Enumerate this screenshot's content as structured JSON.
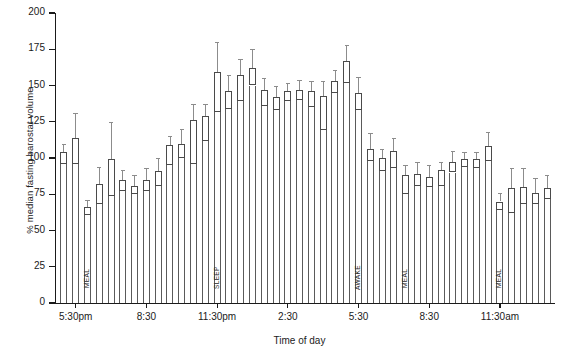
{
  "chart_data": {
    "type": "bar",
    "title": "",
    "xlabel": "Time of day",
    "ylabel": "% median fasting barostat volume",
    "ylim": [
      0,
      200
    ],
    "yticks": [
      0,
      25,
      50,
      75,
      100,
      125,
      150,
      175,
      200
    ],
    "xtick_labels": [
      "5:30pm",
      "8:30",
      "11:30pm",
      "2:30",
      "5:30",
      "8:30",
      "11:30am"
    ],
    "xtick_indices": [
      1,
      7,
      13,
      19,
      25,
      31,
      37
    ],
    "grid": false,
    "legend": null,
    "series_note": "Each bar is a box (interquartile range) drawn on a tall column from zero, with an upper whisker cap.",
    "bars": [
      {
        "i": 0,
        "box_low": 96,
        "box_high": 104,
        "whisker_high": 110,
        "annotation": ""
      },
      {
        "i": 1,
        "box_low": 96,
        "box_high": 114,
        "whisker_high": 131,
        "annotation": ""
      },
      {
        "i": 2,
        "box_low": 61,
        "box_high": 66,
        "whisker_high": 71,
        "annotation": "MEAL"
      },
      {
        "i": 3,
        "box_low": 68,
        "box_high": 82,
        "whisker_high": 94,
        "annotation": ""
      },
      {
        "i": 4,
        "box_low": 74,
        "box_high": 99,
        "whisker_high": 125,
        "annotation": ""
      },
      {
        "i": 5,
        "box_low": 77,
        "box_high": 85,
        "whisker_high": 92,
        "annotation": ""
      },
      {
        "i": 6,
        "box_low": 75,
        "box_high": 81,
        "whisker_high": 88,
        "annotation": ""
      },
      {
        "i": 7,
        "box_low": 77,
        "box_high": 85,
        "whisker_high": 93,
        "annotation": ""
      },
      {
        "i": 8,
        "box_low": 81,
        "box_high": 91,
        "whisker_high": 100,
        "annotation": ""
      },
      {
        "i": 9,
        "box_low": 95,
        "box_high": 109,
        "whisker_high": 115,
        "annotation": ""
      },
      {
        "i": 10,
        "box_low": 100,
        "box_high": 110,
        "whisker_high": 120,
        "annotation": ""
      },
      {
        "i": 11,
        "box_low": 96,
        "box_high": 126,
        "whisker_high": 137,
        "annotation": ""
      },
      {
        "i": 12,
        "box_low": 112,
        "box_high": 129,
        "whisker_high": 137,
        "annotation": ""
      },
      {
        "i": 13,
        "box_low": 132,
        "box_high": 159,
        "whisker_high": 180,
        "annotation": "SLEEP"
      },
      {
        "i": 14,
        "box_low": 134,
        "box_high": 146,
        "whisker_high": 157,
        "annotation": ""
      },
      {
        "i": 15,
        "box_low": 139,
        "box_high": 157,
        "whisker_high": 168,
        "annotation": ""
      },
      {
        "i": 16,
        "box_low": 150,
        "box_high": 162,
        "whisker_high": 175,
        "annotation": ""
      },
      {
        "i": 17,
        "box_low": 136,
        "box_high": 147,
        "whisker_high": 155,
        "annotation": ""
      },
      {
        "i": 18,
        "box_low": 133,
        "box_high": 142,
        "whisker_high": 150,
        "annotation": ""
      },
      {
        "i": 19,
        "box_low": 139,
        "box_high": 146,
        "whisker_high": 152,
        "annotation": ""
      },
      {
        "i": 20,
        "box_low": 140,
        "box_high": 147,
        "whisker_high": 154,
        "annotation": ""
      },
      {
        "i": 21,
        "box_low": 135,
        "box_high": 146,
        "whisker_high": 153,
        "annotation": ""
      },
      {
        "i": 22,
        "box_low": 119,
        "box_high": 143,
        "whisker_high": 153,
        "annotation": ""
      },
      {
        "i": 23,
        "box_low": 145,
        "box_high": 153,
        "whisker_high": 161,
        "annotation": ""
      },
      {
        "i": 24,
        "box_low": 152,
        "box_high": 167,
        "whisker_high": 178,
        "annotation": ""
      },
      {
        "i": 25,
        "box_low": 133,
        "box_high": 145,
        "whisker_high": 156,
        "annotation": "AWAKE"
      },
      {
        "i": 26,
        "box_low": 98,
        "box_high": 106,
        "whisker_high": 117,
        "annotation": ""
      },
      {
        "i": 27,
        "box_low": 91,
        "box_high": 100,
        "whisker_high": 106,
        "annotation": ""
      },
      {
        "i": 28,
        "box_low": 93,
        "box_high": 105,
        "whisker_high": 114,
        "annotation": ""
      },
      {
        "i": 29,
        "box_low": 75,
        "box_high": 88,
        "whisker_high": 95,
        "annotation": "MEAL"
      },
      {
        "i": 30,
        "box_low": 81,
        "box_high": 89,
        "whisker_high": 97,
        "annotation": ""
      },
      {
        "i": 31,
        "box_low": 80,
        "box_high": 87,
        "whisker_high": 95,
        "annotation": ""
      },
      {
        "i": 32,
        "box_low": 81,
        "box_high": 92,
        "whisker_high": 97,
        "annotation": ""
      },
      {
        "i": 33,
        "box_low": 90,
        "box_high": 97,
        "whisker_high": 105,
        "annotation": ""
      },
      {
        "i": 34,
        "box_low": 94,
        "box_high": 99,
        "whisker_high": 104,
        "annotation": ""
      },
      {
        "i": 35,
        "box_low": 93,
        "box_high": 99,
        "whisker_high": 104,
        "annotation": ""
      },
      {
        "i": 36,
        "box_low": 98,
        "box_high": 108,
        "whisker_high": 118,
        "annotation": ""
      },
      {
        "i": 37,
        "box_low": 64,
        "box_high": 70,
        "whisker_high": 76,
        "annotation": "MEAL"
      },
      {
        "i": 38,
        "box_low": 62,
        "box_high": 79,
        "whisker_high": 93,
        "annotation": ""
      },
      {
        "i": 39,
        "box_low": 68,
        "box_high": 80,
        "whisker_high": 93,
        "annotation": ""
      },
      {
        "i": 40,
        "box_low": 68,
        "box_high": 76,
        "whisker_high": 86,
        "annotation": ""
      },
      {
        "i": 41,
        "box_low": 72,
        "box_high": 79,
        "whisker_high": 88,
        "annotation": ""
      }
    ]
  }
}
